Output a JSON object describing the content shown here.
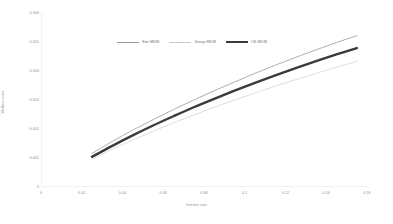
{
  "chart_data": {
    "type": "line",
    "title": "",
    "xlabel": "Interest rate",
    "ylabel": "Welfare costs",
    "xlim": [
      0,
      0.16
    ],
    "ylim": [
      0,
      0.006
    ],
    "grid": false,
    "legend_position": "top-center",
    "x_ticks": [
      "0",
      "0.02",
      "0.04",
      "0.06",
      "0.08",
      "0.1",
      "0.12",
      "0.14",
      "0.16"
    ],
    "x_tick_values": [
      0,
      0.02,
      0.04,
      0.06,
      0.08,
      0.1,
      0.12,
      0.14,
      0.16
    ],
    "y_ticks": [
      "0",
      "0.001",
      "0.002",
      "0.003",
      "0.004",
      "0.005",
      "0.006"
    ],
    "y_tick_values": [
      0,
      0.001,
      0.002,
      0.003,
      0.004,
      0.005,
      0.006
    ],
    "x": [
      0.025,
      0.035,
      0.045,
      0.055,
      0.065,
      0.075,
      0.085,
      0.095,
      0.105,
      0.115,
      0.125,
      0.135,
      0.145,
      0.155
    ],
    "series": [
      {
        "name": "Sim MDM",
        "color": "#9a9a9a",
        "width": 0.8,
        "values": [
          0.00116,
          0.00157,
          0.00196,
          0.00232,
          0.00267,
          0.003,
          0.00332,
          0.00362,
          0.00392,
          0.0042,
          0.00447,
          0.00473,
          0.00498,
          0.00522
        ]
      },
      {
        "name": "Group MDM",
        "color": "#c8c8c8",
        "width": 0.6,
        "values": [
          0.00096,
          0.0013,
          0.00162,
          0.00192,
          0.00221,
          0.00248,
          0.00275,
          0.003,
          0.00324,
          0.00348,
          0.0037,
          0.00392,
          0.00413,
          0.00433
        ]
      },
      {
        "name": "CE MDM",
        "color": "#3a3a3a",
        "width": 2.4,
        "values": [
          0.00104,
          0.00142,
          0.00178,
          0.00212,
          0.00244,
          0.00275,
          0.00304,
          0.00332,
          0.00359,
          0.00385,
          0.0041,
          0.00434,
          0.00457,
          0.00479
        ]
      }
    ]
  },
  "legend": {
    "items": [
      {
        "label": "Sim MDM"
      },
      {
        "label": "Group MDM"
      },
      {
        "label": "CE MDM"
      }
    ]
  },
  "axes": {
    "x_title": "Interest rate",
    "y_title": "Welfare costs"
  }
}
